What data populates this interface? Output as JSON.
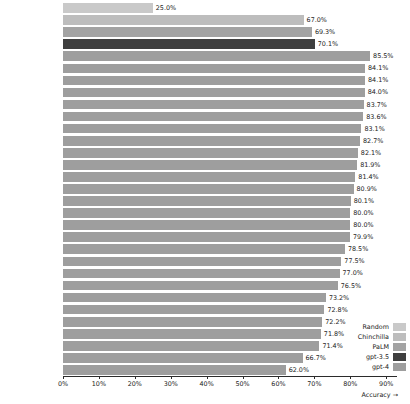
{
  "chart_data": {
    "type": "bar",
    "orientation": "horizontal",
    "title": "",
    "xlabel": "Accuracy →",
    "ylabel": "",
    "xlim": [
      0,
      93
    ],
    "grid": false,
    "xticks": [
      0,
      10,
      20,
      30,
      40,
      50,
      60,
      70,
      80,
      90
    ],
    "xticklabels": [
      "0%",
      "10%",
      "20%",
      "30%",
      "40%",
      "50%",
      "60%",
      "70%",
      "80%",
      "90%"
    ],
    "legend_position": "lower right",
    "legend": [
      {
        "name": "Random",
        "color": "#c9c9c9"
      },
      {
        "name": "Chinchilla",
        "color": "#bdbdbd"
      },
      {
        "name": "PaLM",
        "color": "#a3a3a3"
      },
      {
        "name": "gpt-3.5",
        "color": "#3f3f3f"
      },
      {
        "name": "gpt-4",
        "color": "#9e9e9e"
      }
    ],
    "categories": [
      "Random guessing",
      "Chinchilla-English",
      "PaLM-English",
      "GPT-3.5-English",
      "GPT-4 English",
      "Italian",
      "Afrikaans",
      "Spanish",
      "German",
      "French",
      "Indonesian",
      "Russian",
      "Polish",
      "Ukranian",
      "Greek",
      "Latvian",
      "Mandarin",
      "Arabic",
      "Turkish",
      "Japanese",
      "Swahili",
      "Welsh",
      "Korean",
      "Icelandic",
      "Bengali",
      "Urdu",
      "Nepali",
      "Thai",
      "Punjabi",
      "Marathi",
      "Telugu"
    ],
    "values": [
      25.0,
      67.0,
      69.3,
      70.1,
      85.5,
      84.1,
      84.1,
      84.0,
      83.7,
      83.6,
      83.1,
      82.7,
      82.1,
      81.9,
      81.4,
      80.9,
      80.1,
      80.0,
      80.0,
      79.9,
      78.5,
      77.5,
      77.0,
      76.5,
      73.2,
      72.8,
      72.2,
      71.8,
      71.4,
      66.7,
      62.0
    ],
    "value_labels": [
      "25.0%",
      "67.0%",
      "69.3%",
      "70.1%",
      "85.5%",
      "84.1%",
      "84.1%",
      "84.0%",
      "83.7%",
      "83.6%",
      "83.1%",
      "82.7%",
      "82.1%",
      "81.9%",
      "81.4%",
      "80.9%",
      "80.1%",
      "80.0%",
      "80.0%",
      "79.9%",
      "78.5%",
      "77.5%",
      "77.0%",
      "76.5%",
      "73.2%",
      "72.8%",
      "72.2%",
      "71.8%",
      "71.4%",
      "66.7%",
      "62.0%"
    ],
    "series_of_bar": [
      "Random",
      "Chinchilla",
      "PaLM",
      "gpt-3.5",
      "gpt-4",
      "gpt-4",
      "gpt-4",
      "gpt-4",
      "gpt-4",
      "gpt-4",
      "gpt-4",
      "gpt-4",
      "gpt-4",
      "gpt-4",
      "gpt-4",
      "gpt-4",
      "gpt-4",
      "gpt-4",
      "gpt-4",
      "gpt-4",
      "gpt-4",
      "gpt-4",
      "gpt-4",
      "gpt-4",
      "gpt-4",
      "gpt-4",
      "gpt-4",
      "gpt-4",
      "gpt-4",
      "gpt-4",
      "gpt-4"
    ],
    "bar_colors": [
      "#c9c9c9",
      "#bdbdbd",
      "#a3a3a3",
      "#3f3f3f",
      "#9e9e9e",
      "#9e9e9e",
      "#9e9e9e",
      "#9e9e9e",
      "#9e9e9e",
      "#9e9e9e",
      "#9e9e9e",
      "#9e9e9e",
      "#9e9e9e",
      "#9e9e9e",
      "#9e9e9e",
      "#9e9e9e",
      "#9e9e9e",
      "#9e9e9e",
      "#9e9e9e",
      "#9e9e9e",
      "#9e9e9e",
      "#9e9e9e",
      "#9e9e9e",
      "#9e9e9e",
      "#9e9e9e",
      "#9e9e9e",
      "#9e9e9e",
      "#9e9e9e",
      "#9e9e9e",
      "#9e9e9e",
      "#9e9e9e"
    ]
  }
}
